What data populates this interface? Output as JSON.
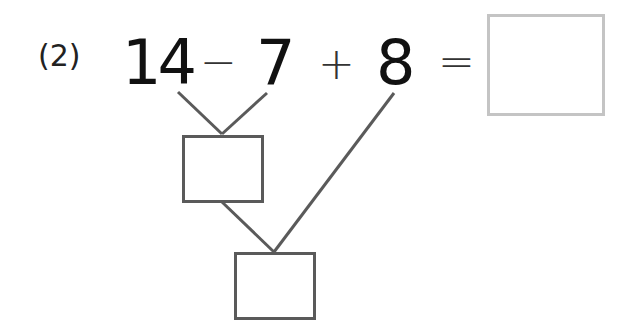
{
  "problem": {
    "label": "(2)",
    "operand1": "14",
    "operator1": "−",
    "operand2": "7",
    "operator2": "+",
    "operand3": "8",
    "equals": "="
  },
  "answer_box": {
    "value": ""
  },
  "intermediate_box": {
    "value": ""
  },
  "final_box": {
    "value": ""
  },
  "colors": {
    "text": "#111111",
    "lines": "#5a5a5a",
    "answer_border": "#c4c4c4"
  }
}
